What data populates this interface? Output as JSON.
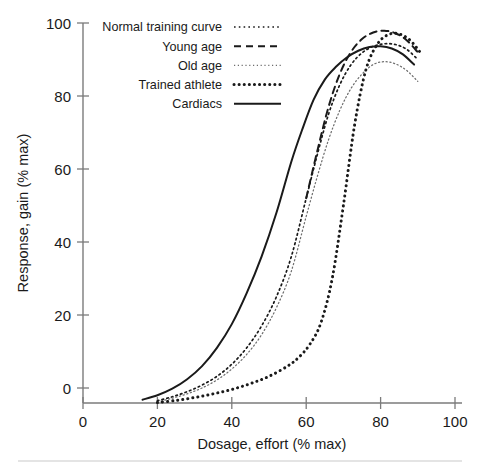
{
  "chart_data": {
    "type": "line",
    "title": "",
    "xlabel": "Dosage, effort (% max)",
    "ylabel": "Response, gain (% max)",
    "xlim": [
      0,
      100
    ],
    "ylim": [
      -5,
      100
    ],
    "xticks": [
      "0",
      "20",
      "40",
      "60",
      "80",
      "100"
    ],
    "xtick_values": [
      0,
      20,
      40,
      60,
      80,
      100
    ],
    "yticks": [
      "0",
      "20",
      "40",
      "60",
      "80",
      "100"
    ],
    "ytick_values": [
      0,
      20,
      40,
      60,
      80,
      100
    ],
    "grid": false,
    "legend_position": "top-left",
    "series": [
      {
        "name": "Normal training curve",
        "style": "dotted-fine",
        "x": [
          20,
          24,
          28,
          32,
          36,
          40,
          44,
          48,
          52,
          56,
          60,
          63,
          66,
          69,
          72,
          75,
          78,
          81,
          84,
          87,
          90
        ],
        "y": [
          -3.5,
          -2.4,
          -1.0,
          0.8,
          3.2,
          6.5,
          11.0,
          17.0,
          25.0,
          36.0,
          52.0,
          64.0,
          75.0,
          83.0,
          88.5,
          91.8,
          93.6,
          94.3,
          94.1,
          92.8,
          90.0
        ]
      },
      {
        "name": "Young age",
        "style": "dashed",
        "x": [
          60,
          63,
          66,
          69,
          72,
          75,
          78,
          81,
          84,
          87,
          90
        ],
        "y": [
          52.0,
          65.0,
          77.0,
          86.0,
          92.0,
          95.6,
          97.4,
          97.9,
          97.2,
          95.3,
          92.0
        ]
      },
      {
        "name": "Old age",
        "style": "dotted-light",
        "x": [
          20,
          24,
          28,
          32,
          36,
          40,
          44,
          48,
          52,
          56,
          60,
          63,
          66,
          69,
          72,
          75,
          78,
          81,
          84,
          87,
          90
        ],
        "y": [
          -3.8,
          -2.8,
          -1.6,
          0.0,
          2.2,
          5.2,
          9.2,
          14.6,
          22.0,
          32.0,
          47.0,
          58.0,
          68.0,
          76.0,
          82.0,
          86.0,
          88.6,
          89.4,
          88.8,
          87.0,
          84.0
        ]
      },
      {
        "name": "Trained athlete",
        "style": "dotted-bold",
        "x": [
          20,
          25,
          30,
          35,
          40,
          45,
          50,
          55,
          58,
          61,
          64,
          67,
          70,
          73,
          76,
          79,
          82,
          85,
          88,
          91
        ],
        "y": [
          -4.0,
          -3.4,
          -2.6,
          -1.6,
          -0.4,
          1.2,
          3.2,
          6.0,
          8.4,
          12.0,
          18.0,
          30.0,
          50.0,
          72.0,
          87.0,
          94.0,
          96.8,
          97.0,
          95.2,
          91.5
        ]
      },
      {
        "name": "Cardiacs",
        "style": "solid",
        "x": [
          16,
          20,
          24,
          28,
          32,
          36,
          40,
          44,
          48,
          52,
          56,
          59,
          62,
          65,
          68,
          71,
          74,
          77,
          80,
          83,
          86,
          89
        ],
        "y": [
          -3.2,
          -2.0,
          -0.2,
          2.4,
          6.0,
          11.0,
          17.5,
          26.0,
          36.0,
          48.0,
          62.0,
          71.0,
          79.0,
          84.5,
          88.0,
          90.6,
          92.4,
          93.4,
          93.6,
          93.0,
          91.4,
          88.6
        ]
      }
    ]
  },
  "legend": {
    "entries": [
      {
        "label": "Normal training curve",
        "style": "dotted-fine"
      },
      {
        "label": "Young age",
        "style": "dashed"
      },
      {
        "label": "Old age",
        "style": "dotted-light"
      },
      {
        "label": "Trained athlete",
        "style": "dotted-bold"
      },
      {
        "label": "Cardiacs",
        "style": "solid"
      }
    ]
  },
  "colors": {
    "ink": "#1a1a1a",
    "axis": "#7b7b7b",
    "light_curve": "#6e6e6e",
    "divider": "#c9c9c9",
    "background": "#ffffff"
  }
}
